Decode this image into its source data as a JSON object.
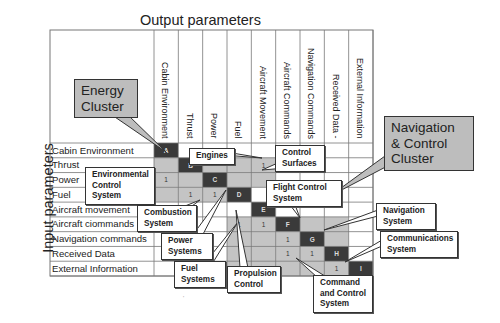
{
  "titles": {
    "output": "Output parameters",
    "input": "Input parameters"
  },
  "columns": [
    "Cabin Environment",
    "Thrust",
    "Power",
    "Fuel",
    "Aircraft Movement",
    "Aircraft Commands",
    "Navigation Commands",
    "Received Data -",
    "External Information"
  ],
  "rows": [
    "Cabin Environment",
    "Thrust",
    "Power",
    "Fuel",
    "Aircraft movement",
    "Aircraft ciommands",
    "Navigation commands",
    "Received Data",
    "External Information"
  ],
  "diagonal_labels": [
    "A",
    "B",
    "C",
    "D",
    "E",
    "F",
    "G",
    "H",
    "I"
  ],
  "matrix": {
    "legend": {
      "dark": "subsystem (diagonal)",
      "gray": "cluster region",
      "one": "dependency"
    },
    "colors": {
      "dark": "#3a3a3a",
      "gray": "#c4c4c4",
      "white": "#ffffff",
      "grid": "#777777"
    },
    "cells": [
      [
        "D",
        "W",
        "W",
        "W",
        "W",
        "W",
        "W",
        "W",
        "W"
      ],
      [
        "G",
        "D",
        "G",
        "G",
        "1",
        "W",
        "W",
        "W",
        "W"
      ],
      [
        "1",
        "G",
        "D",
        "G",
        "G",
        "W",
        "W",
        "W",
        "W"
      ],
      [
        "G",
        "1",
        "1",
        "D",
        "W",
        "W",
        "W",
        "W",
        "W"
      ],
      [
        "W",
        "W",
        "W",
        "W",
        "D",
        "W",
        "W",
        "W",
        "W"
      ],
      [
        "W",
        "W",
        "W",
        "1",
        "1",
        "D",
        "G",
        "G",
        "W"
      ],
      [
        "W",
        "W",
        "W",
        "G",
        "G",
        "1",
        "D",
        "G",
        "W"
      ],
      [
        "W",
        "W",
        "W",
        "G",
        "G",
        "1",
        "1",
        "D",
        "W"
      ],
      [
        "W",
        "W",
        "W",
        "G",
        "G",
        "G",
        "G",
        "1",
        "D"
      ]
    ]
  },
  "clusters": {
    "energy": "Energy Cluster",
    "navigation": "Navigation & Control Cluster"
  },
  "callouts": {
    "engines": "Engines",
    "control_surfaces": "Control Surfaces",
    "environmental": "Environmental Control System",
    "combustion": "Combustion System",
    "flight_control": "Flight Control System",
    "power_systems": "Power Systems",
    "fuel_systems": "Fuel Systems",
    "propulsion": "Propulsion Control",
    "navigation_system": "Navigation System",
    "communications": "Communications System",
    "command_control": "Command and Control System"
  },
  "footer_mark": "'"
}
